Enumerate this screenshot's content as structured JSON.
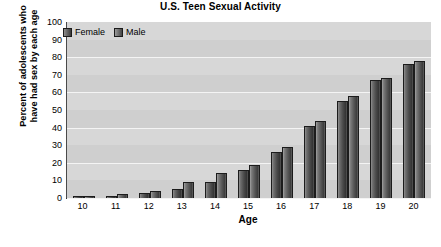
{
  "chart_data": {
    "type": "bar",
    "title": "U.S. Teen Sexual Activity",
    "xlabel": "Age",
    "ylabel_line1": "Percent of adolescents who",
    "ylabel_line2": "have had sex by each age",
    "ylim": [
      0,
      100
    ],
    "yticks": [
      100,
      90,
      80,
      70,
      60,
      50,
      40,
      30,
      20,
      10,
      0
    ],
    "grid": true,
    "legend_position": "top-left",
    "categories": [
      "10",
      "11",
      "12",
      "13",
      "14",
      "15",
      "16",
      "17",
      "18",
      "19",
      "20"
    ],
    "series": [
      {
        "name": "Female",
        "color": "#4a4a4a",
        "values": [
          1,
          1,
          3,
          5,
          9,
          16,
          26,
          41,
          55,
          67,
          76
        ]
      },
      {
        "name": "Male",
        "color": "#565656",
        "values": [
          1,
          2,
          4,
          9,
          14,
          19,
          29,
          44,
          58,
          68,
          78
        ]
      }
    ]
  }
}
